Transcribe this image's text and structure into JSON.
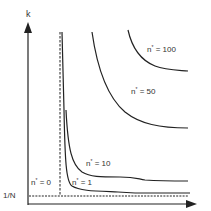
{
  "diagram": {
    "axes": {
      "y_label": "k",
      "x_label": "",
      "y_tick_label": "1/N"
    },
    "curves": [
      {
        "name": "n* = 0",
        "prefix": "n",
        "sup": "*",
        "suffix": " = 0",
        "style": "dashed"
      },
      {
        "name": "n* = 1",
        "prefix": "n",
        "sup": "*",
        "suffix": " = 1",
        "style": "solid"
      },
      {
        "name": "n* = 10",
        "prefix": "n",
        "sup": "*",
        "suffix": " = 10",
        "style": "solid"
      },
      {
        "name": "n* = 50",
        "prefix": "n",
        "sup": "*",
        "suffix": " = 50",
        "style": "solid"
      },
      {
        "name": "n* = 100",
        "prefix": "n",
        "sup": "*",
        "suffix": " = 100",
        "style": "solid"
      }
    ],
    "colors": {
      "line": "#222222",
      "text": "#333333",
      "background": "#ffffff"
    }
  }
}
